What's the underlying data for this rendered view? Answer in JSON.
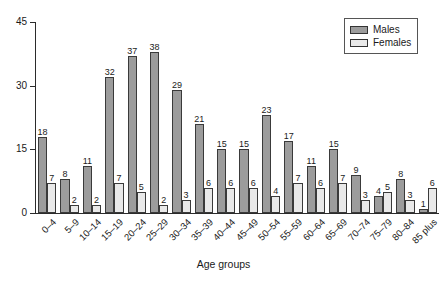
{
  "chart_data": {
    "type": "bar",
    "title": "",
    "xlabel": "Age groups",
    "ylabel": "",
    "ylim": [
      0,
      45
    ],
    "yticks": [
      0,
      15,
      30,
      45
    ],
    "grid": false,
    "legend_position": "top-right",
    "categories": [
      "0–4",
      "5–9",
      "10–14",
      "15–19",
      "20–24",
      "25–29",
      "30–34",
      "35–39",
      "40–44",
      "45–49",
      "50–54",
      "55–59",
      "60–64",
      "65–69",
      "70–74",
      "75–79",
      "80–84",
      "85 plus"
    ],
    "series": [
      {
        "name": "Males",
        "color": "#9c9c9c",
        "values": [
          18,
          8,
          11,
          32,
          37,
          38,
          29,
          21,
          15,
          15,
          23,
          17,
          11,
          15,
          9,
          4,
          8,
          1
        ]
      },
      {
        "name": "Females",
        "color": "#e9e9e9",
        "values": [
          7,
          2,
          2,
          7,
          5,
          2,
          3,
          6,
          6,
          6,
          4,
          7,
          6,
          7,
          3,
          5,
          3,
          6
        ]
      }
    ]
  },
  "legend": {
    "items": [
      {
        "label": "Males",
        "color": "#9c9c9c"
      },
      {
        "label": "Females",
        "color": "#e9e9e9"
      }
    ]
  },
  "axis": {
    "x_title": "Age groups"
  }
}
